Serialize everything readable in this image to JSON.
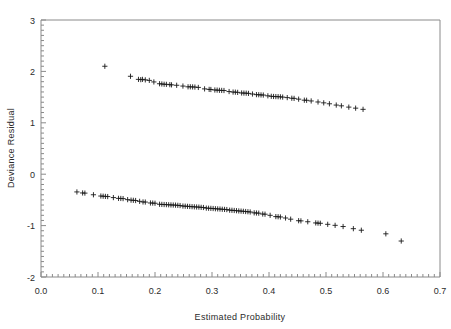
{
  "chart_data": {
    "type": "scatter",
    "title": "",
    "xlabel": "Estimated  Probability",
    "ylabel": "Deviance Residual",
    "xlim": [
      0.0,
      0.7
    ],
    "ylim": [
      -2,
      3
    ],
    "grid": false,
    "legend": false,
    "marker": "plus",
    "marker_color": "#1a1a1a",
    "frame_color": "#8a8a8a",
    "xticks": [
      0.0,
      0.1,
      0.2,
      0.3,
      0.4,
      0.5,
      0.6,
      0.7
    ],
    "xtick_labels": [
      "0.0",
      "0.1",
      "0.2",
      "0.3",
      "0.4",
      "0.5",
      "0.6",
      "0.7"
    ],
    "x_minor_tick_step": 0.01,
    "yticks": [
      3,
      2,
      1,
      0,
      -1,
      -2
    ],
    "ytick_labels": [
      "3",
      "2",
      "1",
      "0",
      "-1",
      "-2"
    ],
    "y_minor_tick_step": 0.1,
    "series": [
      {
        "name": "positive-residuals",
        "points": [
          [
            0.112,
            2.1
          ],
          [
            0.157,
            1.905
          ],
          [
            0.171,
            1.845
          ],
          [
            0.175,
            1.84
          ],
          [
            0.178,
            1.845
          ],
          [
            0.183,
            1.835
          ],
          [
            0.19,
            1.825
          ],
          [
            0.198,
            1.795
          ],
          [
            0.208,
            1.76
          ],
          [
            0.212,
            1.755
          ],
          [
            0.216,
            1.75
          ],
          [
            0.22,
            1.748
          ],
          [
            0.226,
            1.742
          ],
          [
            0.229,
            1.738
          ],
          [
            0.238,
            1.73
          ],
          [
            0.249,
            1.715
          ],
          [
            0.258,
            1.7
          ],
          [
            0.262,
            1.7
          ],
          [
            0.266,
            1.698
          ],
          [
            0.27,
            1.695
          ],
          [
            0.276,
            1.688
          ],
          [
            0.287,
            1.66
          ],
          [
            0.295,
            1.65
          ],
          [
            0.298,
            1.648
          ],
          [
            0.305,
            1.638
          ],
          [
            0.309,
            1.636
          ],
          [
            0.313,
            1.632
          ],
          [
            0.317,
            1.63
          ],
          [
            0.321,
            1.628
          ],
          [
            0.33,
            1.608
          ],
          [
            0.337,
            1.598
          ],
          [
            0.341,
            1.596
          ],
          [
            0.345,
            1.592
          ],
          [
            0.352,
            1.58
          ],
          [
            0.356,
            1.578
          ],
          [
            0.36,
            1.576
          ],
          [
            0.364,
            1.572
          ],
          [
            0.371,
            1.56
          ],
          [
            0.378,
            1.548
          ],
          [
            0.382,
            1.546
          ],
          [
            0.386,
            1.542
          ],
          [
            0.39,
            1.54
          ],
          [
            0.398,
            1.525
          ],
          [
            0.404,
            1.515
          ],
          [
            0.408,
            1.512
          ],
          [
            0.412,
            1.51
          ],
          [
            0.416,
            1.508
          ],
          [
            0.42,
            1.505
          ],
          [
            0.424,
            1.5
          ],
          [
            0.432,
            1.49
          ],
          [
            0.44,
            1.478
          ],
          [
            0.444,
            1.475
          ],
          [
            0.452,
            1.46
          ],
          [
            0.462,
            1.44
          ],
          [
            0.466,
            1.438
          ],
          [
            0.474,
            1.425
          ],
          [
            0.486,
            1.405
          ],
          [
            0.496,
            1.388
          ],
          [
            0.506,
            1.37
          ],
          [
            0.518,
            1.345
          ],
          [
            0.527,
            1.33
          ],
          [
            0.54,
            1.305
          ],
          [
            0.552,
            1.285
          ],
          [
            0.565,
            1.262
          ]
        ]
      },
      {
        "name": "negative-residuals",
        "points": [
          [
            0.063,
            -0.345
          ],
          [
            0.073,
            -0.365
          ],
          [
            0.077,
            -0.368
          ],
          [
            0.092,
            -0.4
          ],
          [
            0.105,
            -0.425
          ],
          [
            0.109,
            -0.428
          ],
          [
            0.113,
            -0.432
          ],
          [
            0.117,
            -0.435
          ],
          [
            0.127,
            -0.455
          ],
          [
            0.136,
            -0.47
          ],
          [
            0.14,
            -0.472
          ],
          [
            0.144,
            -0.475
          ],
          [
            0.152,
            -0.495
          ],
          [
            0.158,
            -0.505
          ],
          [
            0.162,
            -0.508
          ],
          [
            0.166,
            -0.512
          ],
          [
            0.173,
            -0.528
          ],
          [
            0.179,
            -0.54
          ],
          [
            0.183,
            -0.542
          ],
          [
            0.192,
            -0.56
          ],
          [
            0.196,
            -0.562
          ],
          [
            0.2,
            -0.565
          ],
          [
            0.208,
            -0.585
          ],
          [
            0.212,
            -0.588
          ],
          [
            0.216,
            -0.59
          ],
          [
            0.22,
            -0.592
          ],
          [
            0.224,
            -0.595
          ],
          [
            0.228,
            -0.598
          ],
          [
            0.232,
            -0.6
          ],
          [
            0.236,
            -0.602
          ],
          [
            0.24,
            -0.606
          ],
          [
            0.244,
            -0.61
          ],
          [
            0.249,
            -0.62
          ],
          [
            0.253,
            -0.622
          ],
          [
            0.257,
            -0.625
          ],
          [
            0.261,
            -0.628
          ],
          [
            0.265,
            -0.632
          ],
          [
            0.269,
            -0.635
          ],
          [
            0.273,
            -0.638
          ],
          [
            0.277,
            -0.64
          ],
          [
            0.281,
            -0.645
          ],
          [
            0.285,
            -0.648
          ],
          [
            0.29,
            -0.66
          ],
          [
            0.294,
            -0.662
          ],
          [
            0.298,
            -0.665
          ],
          [
            0.302,
            -0.668
          ],
          [
            0.306,
            -0.672
          ],
          [
            0.31,
            -0.675
          ],
          [
            0.314,
            -0.678
          ],
          [
            0.318,
            -0.682
          ],
          [
            0.322,
            -0.685
          ],
          [
            0.326,
            -0.688
          ],
          [
            0.331,
            -0.7
          ],
          [
            0.335,
            -0.702
          ],
          [
            0.339,
            -0.706
          ],
          [
            0.343,
            -0.71
          ],
          [
            0.347,
            -0.715
          ],
          [
            0.351,
            -0.718
          ],
          [
            0.355,
            -0.722
          ],
          [
            0.359,
            -0.726
          ],
          [
            0.363,
            -0.73
          ],
          [
            0.367,
            -0.735
          ],
          [
            0.374,
            -0.752
          ],
          [
            0.378,
            -0.755
          ],
          [
            0.382,
            -0.758
          ],
          [
            0.389,
            -0.775
          ],
          [
            0.393,
            -0.778
          ],
          [
            0.402,
            -0.8
          ],
          [
            0.412,
            -0.825
          ],
          [
            0.416,
            -0.828
          ],
          [
            0.42,
            -0.832
          ],
          [
            0.429,
            -0.852
          ],
          [
            0.438,
            -0.875
          ],
          [
            0.452,
            -0.905
          ],
          [
            0.456,
            -0.908
          ],
          [
            0.468,
            -0.925
          ],
          [
            0.482,
            -0.948
          ],
          [
            0.486,
            -0.952
          ],
          [
            0.49,
            -0.955
          ],
          [
            0.503,
            -0.975
          ],
          [
            0.516,
            -0.995
          ],
          [
            0.53,
            -1.018
          ],
          [
            0.548,
            -1.06
          ],
          [
            0.562,
            -1.09
          ],
          [
            0.605,
            -1.16
          ],
          [
            0.632,
            -1.3
          ]
        ]
      }
    ]
  },
  "geometry": {
    "plot_left": 41,
    "plot_right": 440,
    "plot_top": 20,
    "plot_bottom": 277
  }
}
